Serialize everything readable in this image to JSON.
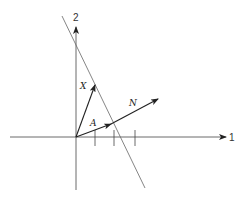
{
  "diagram": {
    "axes": {
      "horizontal_label": "1",
      "vertical_label": "2"
    },
    "vectors": [
      {
        "name": "X",
        "label": "X"
      },
      {
        "name": "A",
        "label": "A"
      },
      {
        "name": "N",
        "label": "N"
      }
    ],
    "tick_count": 3,
    "colors": {
      "ink": "#222222",
      "line": "#555555"
    }
  }
}
